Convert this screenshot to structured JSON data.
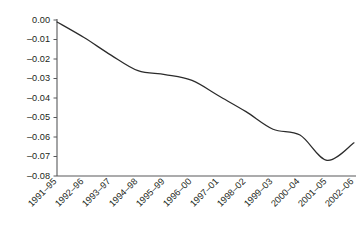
{
  "chart_data": {
    "type": "line",
    "title": "",
    "subtitle": "",
    "xlabel": "",
    "ylabel": "",
    "grid": false,
    "legend": false,
    "legend_position": "none",
    "categories": [
      "1991–95",
      "1992–96",
      "1993–97",
      "1994–98",
      "1995–99",
      "1996–00",
      "1997–01",
      "1998–02",
      "1999–03",
      "2000–04",
      "2001–05",
      "2002–06"
    ],
    "values": [
      -0.001,
      -0.009,
      -0.018,
      -0.026,
      -0.028,
      -0.031,
      -0.039,
      -0.047,
      -0.056,
      -0.059,
      -0.072,
      -0.063
    ],
    "ylim": [
      -0.08,
      0.0
    ],
    "ytick_labels": [
      "0.00",
      "–0.01",
      "–0.02",
      "–0.03",
      "–0.04",
      "–0.05",
      "–0.06",
      "–0.07",
      "–0.08"
    ],
    "ytick_values": [
      0.0,
      -0.01,
      -0.02,
      -0.03,
      -0.04,
      -0.05,
      -0.06,
      -0.07,
      -0.08
    ],
    "series": [
      {
        "name": "series-1",
        "color": "#2b2b2b",
        "values": [
          -0.001,
          -0.009,
          -0.018,
          -0.026,
          -0.028,
          -0.031,
          -0.039,
          -0.047,
          -0.056,
          -0.059,
          -0.072,
          -0.063
        ]
      }
    ],
    "colors": {
      "line": "#2b2b2b",
      "axis": "#58595b",
      "text": "#231f20",
      "background": "#ffffff"
    }
  }
}
